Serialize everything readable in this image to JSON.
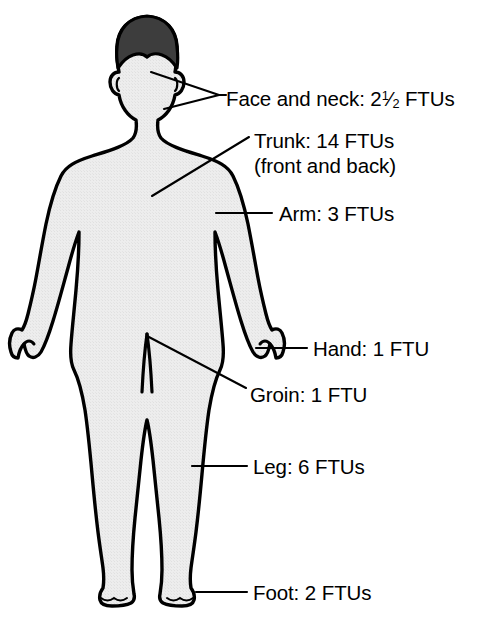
{
  "diagram": {
    "figure_name": "adult-body-front-silhouette",
    "colors": {
      "body_fill": "#eaeaea",
      "body_outline": "#000000",
      "hair_fill": "#3d3d3d",
      "leader_line": "#000000",
      "text": "#000000",
      "background": "#ffffff"
    }
  },
  "labels": {
    "face_and_neck": {
      "region": "Face and neck",
      "prefix": "Face and neck: 2",
      "fraction_numerator": "1",
      "fraction_solidus": "⁄",
      "fraction_denominator": "2",
      "suffix": " FTUs",
      "ftu_value": 2.5,
      "unit": "FTUs"
    },
    "trunk": {
      "region": "Trunk",
      "line1": "Trunk: 14 FTUs",
      "line2": "(front and back)",
      "ftu_value": 14,
      "unit": "FTUs",
      "note": "front and back"
    },
    "arm": {
      "region": "Arm",
      "text": "Arm: 3 FTUs",
      "ftu_value": 3,
      "unit": "FTUs"
    },
    "hand": {
      "region": "Hand",
      "text": "Hand: 1 FTU",
      "ftu_value": 1,
      "unit": "FTU"
    },
    "groin": {
      "region": "Groin",
      "text": "Groin: 1 FTU",
      "ftu_value": 1,
      "unit": "FTU"
    },
    "leg": {
      "region": "Leg",
      "text": "Leg: 6 FTUs",
      "ftu_value": 6,
      "unit": "FTUs"
    },
    "foot": {
      "region": "Foot",
      "text": "Foot: 2 FTUs",
      "ftu_value": 2,
      "unit": "FTUs"
    }
  }
}
